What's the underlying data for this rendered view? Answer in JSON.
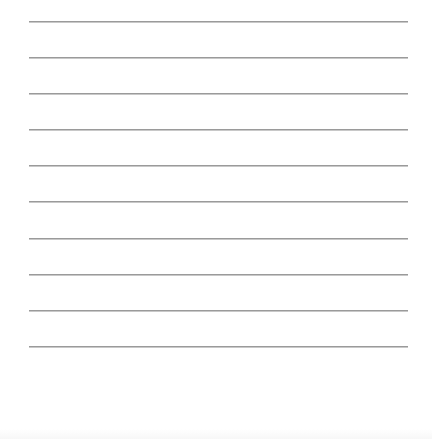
{
  "page": {
    "type": "lined-writing-sheet",
    "background_color": "#ffffff",
    "rule_color": "#9a9a9a",
    "rule_count": 10,
    "rules": [
      {
        "index": 1,
        "y": 21
      },
      {
        "index": 2,
        "y": 57
      },
      {
        "index": 3,
        "y": 93
      },
      {
        "index": 4,
        "y": 129
      },
      {
        "index": 5,
        "y": 165
      },
      {
        "index": 6,
        "y": 201
      },
      {
        "index": 7,
        "y": 238
      },
      {
        "index": 8,
        "y": 274
      },
      {
        "index": 9,
        "y": 310
      },
      {
        "index": 10,
        "y": 346
      }
    ],
    "text_lines": [
      "",
      "",
      "",
      "",
      "",
      "",
      "",
      "",
      "",
      ""
    ]
  }
}
